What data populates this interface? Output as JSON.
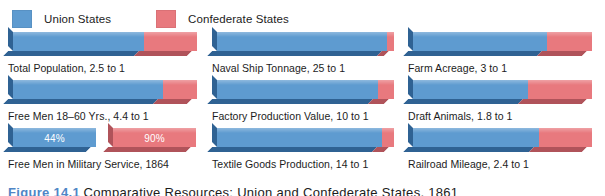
{
  "legend": {
    "union": {
      "label": "Union States",
      "color": "#5e9bd0",
      "icon": "legend-swatch-icon"
    },
    "confederate": {
      "label": "Confederate States",
      "color": "#e8797e",
      "icon": "legend-swatch-icon"
    }
  },
  "colors": {
    "union": "#5e9bd0",
    "confederate": "#e8797e",
    "union_shadow": "#2f6293",
    "confederate_shadow": "#b0535a",
    "background": "#ffffff",
    "caption_accent": "#4f86c6"
  },
  "caption": {
    "number": "Figure 14.1",
    "text": "Comparative Resources: Union and Confederate States, 1861"
  },
  "chart_data": {
    "type": "bar",
    "title": "Comparative Resources: Union and Confederate States, 1861",
    "orientation": "horizontal",
    "stacked": true,
    "grid": false,
    "legend_position": "top-left",
    "xlabel": "",
    "ylabel": "",
    "xlim": [
      0,
      100
    ],
    "series": [
      {
        "name": "Union States",
        "color": "#5e9bd0"
      },
      {
        "name": "Confederate States",
        "color": "#e8797e"
      }
    ],
    "categories": [
      "Total Population",
      "Naval Ship Tonnage",
      "Farm Acreage",
      "Free Men 18–60 Yrs.",
      "Factory Production Value",
      "Draft Animals",
      "Free Men in Military Service, 1864",
      "Textile Goods Production",
      "Railroad Mileage"
    ],
    "items": [
      {
        "id": "total-population",
        "caption": "Total Population, 2.5 to 1",
        "ratio": "2.5 to 1",
        "union_pct": 71.4,
        "confederate_pct": 28.6,
        "mode": "stacked"
      },
      {
        "id": "naval-ship-tonnage",
        "caption": "Naval Ship Tonnage, 25 to 1",
        "ratio": "25 to 1",
        "union_pct": 96.2,
        "confederate_pct": 3.8,
        "mode": "stacked"
      },
      {
        "id": "farm-acreage",
        "caption": "Farm Acreage, 3 to 1",
        "ratio": "3 to 1",
        "union_pct": 75.0,
        "confederate_pct": 25.0,
        "mode": "stacked"
      },
      {
        "id": "free-men-18-60",
        "caption": "Free Men 18–60 Yrs., 4.4 to 1",
        "ratio": "4.4 to 1",
        "union_pct": 81.5,
        "confederate_pct": 18.5,
        "mode": "stacked"
      },
      {
        "id": "factory-production-value",
        "caption": "Factory Production Value, 10 to 1",
        "ratio": "10 to 1",
        "union_pct": 90.9,
        "confederate_pct": 9.1,
        "mode": "stacked"
      },
      {
        "id": "draft-animals",
        "caption": "Draft Animals, 1.8 to 1",
        "ratio": "1.8 to 1",
        "union_pct": 64.3,
        "confederate_pct": 35.7,
        "mode": "stacked"
      },
      {
        "id": "free-men-military-service",
        "caption": "Free Men in Military Service, 1864",
        "ratio": "",
        "union_pct": 44,
        "confederate_pct": 90,
        "union_label": "44%",
        "confederate_label": "90%",
        "mode": "dual"
      },
      {
        "id": "textile-goods-production",
        "caption": "Textile Goods Production, 14 to 1",
        "ratio": "14 to 1",
        "union_pct": 93.3,
        "confederate_pct": 6.7,
        "mode": "stacked"
      },
      {
        "id": "railroad-mileage",
        "caption": "Railroad Mileage, 2.4 to 1",
        "ratio": "2.4 to 1",
        "union_pct": 70.6,
        "confederate_pct": 29.4,
        "mode": "stacked"
      }
    ]
  }
}
